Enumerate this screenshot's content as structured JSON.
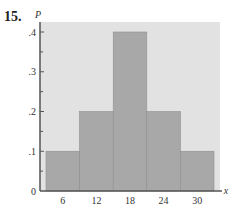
{
  "problem": {
    "number": "15."
  },
  "chart_data": {
    "type": "bar",
    "title": "",
    "xlabel": "x",
    "ylabel": "P",
    "categories": [
      "6",
      "12",
      "18",
      "24",
      "30"
    ],
    "x": [
      6,
      12,
      18,
      24,
      30
    ],
    "values": [
      0.1,
      0.2,
      0.4,
      0.2,
      0.1
    ],
    "ylim": [
      0,
      0.4
    ],
    "yticks": [
      0,
      0.1,
      0.2,
      0.3,
      0.4
    ],
    "ytick_labels": [
      "0",
      ".1",
      ".2",
      ".3",
      ".4"
    ],
    "grid": false,
    "legend": null,
    "style": {
      "background": "#e2e2e2",
      "bar_color": "#a8a8a8",
      "bar_edge": "#8f8f8f",
      "axis_color": "#555555"
    }
  }
}
